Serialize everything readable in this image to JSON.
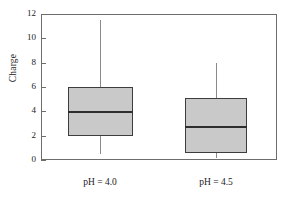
{
  "chart_data": {
    "type": "box",
    "title": "",
    "xlabel": "",
    "ylabel": "Charge",
    "ylim": [
      0,
      12
    ],
    "yticks": [
      0,
      2,
      4,
      6,
      8,
      10,
      12
    ],
    "ytick_labels": [
      "0",
      "2",
      "4",
      "6",
      "8",
      "10",
      "12"
    ],
    "grid": false,
    "legend": "none",
    "categories": [
      "pH = 4.0",
      "pH = 4.5"
    ],
    "boxes": [
      {
        "category": "pH = 4.0",
        "min": 0.5,
        "q1": 2.0,
        "median": 4.0,
        "q3": 6.0,
        "max": 11.5
      },
      {
        "category": "pH = 4.5",
        "min": 0.2,
        "q1": 0.6,
        "median": 2.8,
        "q3": 5.1,
        "max": 8.0
      }
    ],
    "colors": {
      "box_fill": "#c9c9c9",
      "box_edge": "#3d3d3d",
      "median": "#2e2e2e",
      "whisker": "#8a8a8a",
      "axis": "#6d6d6d",
      "background": "#ffffff"
    }
  }
}
